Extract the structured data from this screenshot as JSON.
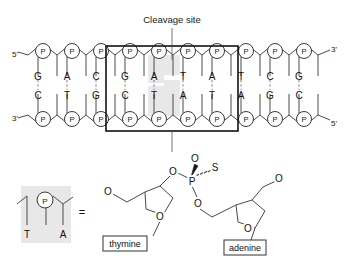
{
  "figure": {
    "title_annotation": "Cleavage site",
    "ends": {
      "top_left": "5'",
      "top_right": "3'",
      "bottom_left": "3'",
      "bottom_right": "5'"
    },
    "phosphate_label": "P",
    "top_strand": [
      "G",
      "A",
      "C",
      "G",
      "A",
      "T",
      "A",
      "T",
      "C",
      "G",
      "T",
      "C"
    ],
    "bottom_strand": [
      "C",
      "T",
      "G",
      "C",
      "T",
      "A",
      "T",
      "A",
      "G",
      "C",
      "A",
      "G"
    ],
    "recognition_site": {
      "top": "GATATC",
      "bottom": "CTATAG",
      "start_index": 3,
      "end_index": 8
    },
    "highlighted_pairs": {
      "top": [
        "T",
        "A"
      ],
      "bottom": [
        "A",
        "T"
      ],
      "indices": [
        5,
        6
      ]
    }
  },
  "legend": {
    "equals_sign": "=",
    "phosphate_label": "P",
    "left_base": "T",
    "right_base": "A"
  },
  "structure": {
    "phosphorus": "P",
    "oxygen": "O",
    "sulfur": "S",
    "oxygen_double_bond": "O",
    "oxygen_left": "O",
    "oxygen_down": "O",
    "oxygen_ring_left": "O",
    "oxygen_ring_right": "O",
    "oxygen_terminal_left": "O",
    "oxygen_terminal_right": "O",
    "base_left_label": "thymine",
    "base_right_label": "adenine"
  },
  "colors": {
    "stroke": "#3a3a3a",
    "text": "#1a1a1a",
    "highlight": "#e6e6e6",
    "box_border": "#111111"
  }
}
